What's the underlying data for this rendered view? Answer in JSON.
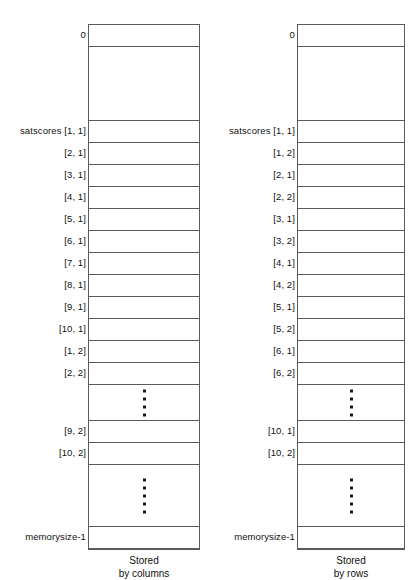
{
  "figure": {
    "columns": [
      {
        "id": "stored-by-columns",
        "caption": "Stored\nby columns",
        "top_label": "0",
        "bottom_label": "memorysize-1",
        "rows": [
          {
            "type": "address",
            "label": "0",
            "size": "std"
          },
          {
            "type": "blank",
            "label": "",
            "size": "tall"
          },
          {
            "type": "element",
            "label": "satscores [1, 1]",
            "size": "std"
          },
          {
            "type": "element",
            "label": "[2, 1]",
            "size": "std"
          },
          {
            "type": "element",
            "label": "[3, 1]",
            "size": "std"
          },
          {
            "type": "element",
            "label": "[4, 1]",
            "size": "std"
          },
          {
            "type": "element",
            "label": "[5, 1]",
            "size": "std"
          },
          {
            "type": "element",
            "label": "[6, 1]",
            "size": "std"
          },
          {
            "type": "element",
            "label": "[7, 1]",
            "size": "std"
          },
          {
            "type": "element",
            "label": "[8, 1]",
            "size": "std"
          },
          {
            "type": "element",
            "label": "[9, 1]",
            "size": "std"
          },
          {
            "type": "element",
            "label": "[10, 1]",
            "size": "std"
          },
          {
            "type": "element",
            "label": "[1, 2]",
            "size": "std"
          },
          {
            "type": "element",
            "label": "[2, 2]",
            "size": "std"
          },
          {
            "type": "ellipsis",
            "label": "",
            "size": "dots4",
            "dots": 4
          },
          {
            "type": "element",
            "label": "[9, 2]",
            "size": "std"
          },
          {
            "type": "element",
            "label": "[10, 2]",
            "size": "std"
          },
          {
            "type": "ellipsis",
            "label": "",
            "size": "dots5",
            "dots": 5
          },
          {
            "type": "address",
            "label": "memorysize-1",
            "size": "std"
          }
        ]
      },
      {
        "id": "stored-by-rows",
        "caption": "Stored\nby rows",
        "top_label": "0",
        "bottom_label": "memorysize-1",
        "rows": [
          {
            "type": "address",
            "label": "0",
            "size": "std"
          },
          {
            "type": "blank",
            "label": "",
            "size": "tall"
          },
          {
            "type": "element",
            "label": "satscores [1, 1]",
            "size": "std"
          },
          {
            "type": "element",
            "label": "[1, 2]",
            "size": "std"
          },
          {
            "type": "element",
            "label": "[2, 1]",
            "size": "std"
          },
          {
            "type": "element",
            "label": "[2, 2]",
            "size": "std"
          },
          {
            "type": "element",
            "label": "[3, 1]",
            "size": "std"
          },
          {
            "type": "element",
            "label": "[3, 2]",
            "size": "std"
          },
          {
            "type": "element",
            "label": "[4, 1]",
            "size": "std"
          },
          {
            "type": "element",
            "label": "[4, 2]",
            "size": "std"
          },
          {
            "type": "element",
            "label": "[5, 1]",
            "size": "std"
          },
          {
            "type": "element",
            "label": "[5, 2]",
            "size": "std"
          },
          {
            "type": "element",
            "label": "[6, 1]",
            "size": "std"
          },
          {
            "type": "element",
            "label": "[6, 2]",
            "size": "std"
          },
          {
            "type": "ellipsis",
            "label": "",
            "size": "dots4",
            "dots": 4
          },
          {
            "type": "element",
            "label": "[10, 1]",
            "size": "std"
          },
          {
            "type": "element",
            "label": "[10, 2]",
            "size": "std"
          },
          {
            "type": "ellipsis",
            "label": "",
            "size": "dots5",
            "dots": 5
          },
          {
            "type": "address",
            "label": "memorysize-1",
            "size": "std"
          }
        ]
      }
    ]
  }
}
